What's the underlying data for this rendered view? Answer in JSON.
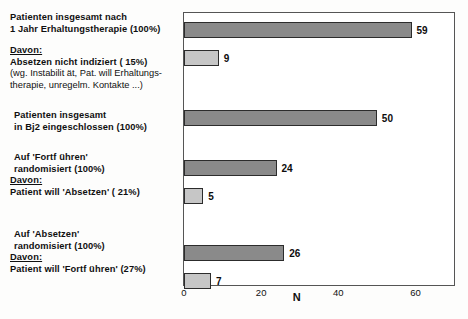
{
  "chart_data": {
    "type": "bar",
    "orientation": "horizontal",
    "title": "",
    "xlabel": "N",
    "ylabel": "",
    "xlim": [
      0,
      70
    ],
    "xticks": [
      0,
      20,
      40,
      60
    ],
    "xtick_labels": [
      "0",
      "20",
      "40",
      "60"
    ],
    "grid": false,
    "legend": false,
    "categories": [
      "Patienten insgesamt nach 1 Jahr Erhaltungstherapie (100%)",
      "Absetzen nicht indiziert ( 15%)",
      "Patienten insgesamt in Bj2 eingeschlossen (100%)",
      "Auf 'Fortführen' randomisiert (100%)",
      "Patient will 'Absetzen' ( 21%)",
      "Auf 'Absetzen' randomisiert (100%)",
      "Patient will 'Fortführen' (27%)"
    ],
    "values": [
      59,
      9,
      50,
      24,
      5,
      26,
      7
    ],
    "value_labels": [
      "59",
      "9",
      "50",
      "24",
      "5",
      "26",
      "7"
    ],
    "bar_styles": [
      "dark",
      "light",
      "dark",
      "dark",
      "light",
      "dark",
      "light"
    ],
    "colors": {
      "dark_bar": "#8a8a8a",
      "light_bar": "#c6c6c6",
      "bar_outline": "#2c2c2c",
      "frame": "#555555",
      "background": "#fdfdfc",
      "text": "#101010"
    }
  },
  "labels": {
    "group1": {
      "line1": "Patienten insgesamt nach",
      "line2": "1 Jahr Erhaltungstherapie (100%)",
      "davon": "Davon:",
      "line3": "Absetzen nicht indiziert (  15%)",
      "note1": "(wg. Instabilit ät, Pat. will Erhaltungs-",
      "note2": "therapie, unregelm. Kontakte  ...)"
    },
    "group2": {
      "line1": "Patienten insgesamt",
      "line2": "in Bj2 eingeschlossen (100%)"
    },
    "group3": {
      "line1": "Auf 'Fortf ühren'",
      "line2": "randomisiert (100%)",
      "davon": "Davon:",
      "line3": "Patient will 'Absetzen' (  21%)"
    },
    "group4": {
      "line1": "Auf 'Absetzen'",
      "line2": "randomisiert (100%)",
      "davon": "Davon:",
      "line3": "Patient will 'Fortf ühren' (27%)"
    }
  },
  "axis": {
    "title": "N",
    "ticks": [
      "0",
      "20",
      "40",
      "60"
    ]
  }
}
